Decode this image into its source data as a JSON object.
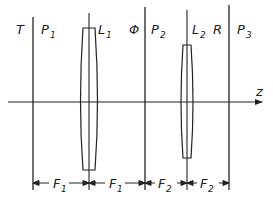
{
  "diagram": {
    "type": "optical-4f-system",
    "axis_label": "z",
    "planes": [
      {
        "name": "T",
        "x": 14
      },
      {
        "name": "P",
        "sub": "1",
        "x": 33
      },
      {
        "name": "L",
        "sub": "1",
        "x": 89
      },
      {
        "name": "Φ",
        "x": 146
      },
      {
        "name": "P",
        "sub": "2",
        "x": 145
      },
      {
        "name": "L",
        "sub": "2",
        "x": 187
      },
      {
        "name": "R",
        "x": 215
      },
      {
        "name": "P",
        "sub": "3",
        "x": 229
      }
    ],
    "labels": {
      "T": "T",
      "P1": "P",
      "P1_sub": "1",
      "L1": "L",
      "L1_sub": "1",
      "Phi": "Φ",
      "P2": "P",
      "P2_sub": "2",
      "L2": "L",
      "L2_sub": "2",
      "R": "R",
      "P3": "P",
      "P3_sub": "3",
      "z": "z"
    },
    "dimensions": [
      {
        "label": "F",
        "sub": "1",
        "from": "P1",
        "to": "L1"
      },
      {
        "label": "F",
        "sub": "1",
        "from": "L1",
        "to": "P2"
      },
      {
        "label": "F",
        "sub": "2",
        "from": "P2",
        "to": "L2"
      },
      {
        "label": "F",
        "sub": "2",
        "from": "L2",
        "to": "P3"
      }
    ],
    "dim_labels": {
      "d1": "F",
      "d1_sub": "1",
      "d2": "F",
      "d2_sub": "1",
      "d3": "F",
      "d3_sub": "2",
      "d4": "F",
      "d4_sub": "2"
    }
  }
}
